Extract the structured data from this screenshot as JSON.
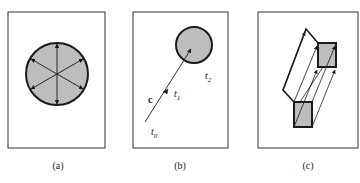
{
  "panels": [
    {
      "id": "a",
      "caption": "(a)",
      "description": "shaded circle with six radial double-headed arrows"
    },
    {
      "id": "b",
      "caption": "(b)",
      "description": "vector c from t0 through t1 to shaded circle, label t2",
      "labels": {
        "vector": "c",
        "t0": "t",
        "t0_sub": "0",
        "t1": "t",
        "t1_sub": "1",
        "t2": "t",
        "t2_sub": "2"
      }
    },
    {
      "id": "c",
      "caption": "(c)",
      "description": "shaded square swept along parallel arrows to translated square"
    }
  ],
  "colors": {
    "fill": "#bdbdbd",
    "stroke": "#1a1a1a",
    "frame": "#333333"
  }
}
